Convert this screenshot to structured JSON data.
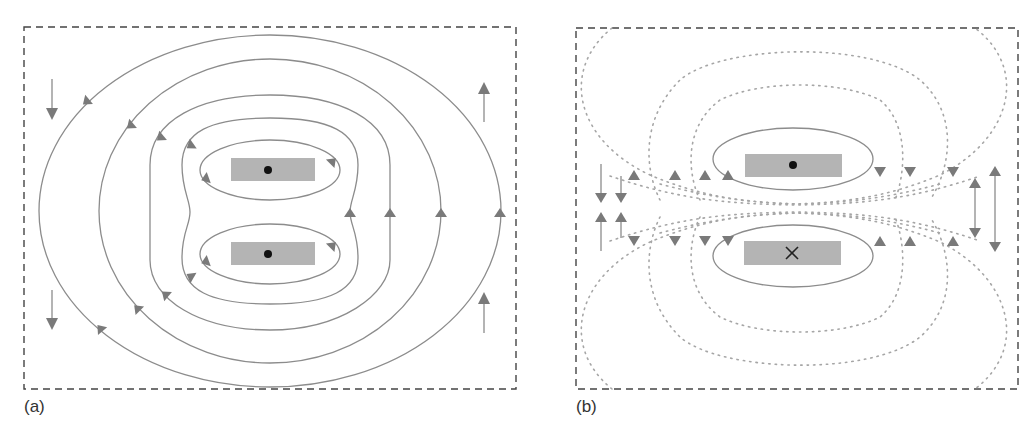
{
  "figure": {
    "panels": [
      {
        "id": "a",
        "label": "(a)",
        "description": "Two parallel conductors carrying current in the same direction (both out of page)",
        "conductors": [
          {
            "position": "top",
            "current_symbol": "dot",
            "meaning": "current out of page"
          },
          {
            "position": "bottom",
            "current_symbol": "dot",
            "meaning": "current out of page"
          }
        ],
        "field_lines": {
          "style": "solid",
          "count_individual_loops": 2,
          "count_enclosing_loops": 4,
          "circulation": "counter-clockwise"
        },
        "boundary_arrows": {
          "left": [
            "down",
            "down"
          ],
          "right": [
            "up",
            "up"
          ]
        }
      },
      {
        "id": "b",
        "label": "(b)",
        "description": "Two parallel conductors carrying current in opposite directions",
        "conductors": [
          {
            "position": "top",
            "current_symbol": "dot",
            "meaning": "current out of page"
          },
          {
            "position": "bottom",
            "current_symbol": "cross",
            "meaning": "current into page"
          }
        ],
        "field_lines": {
          "style": "solid loops near conductors, dotted lines through gap",
          "concentrated_between_conductors": true
        },
        "boundary_arrows": {
          "left": [
            "down",
            "down",
            "up",
            "up"
          ],
          "right": [
            "up/down",
            "up/down"
          ]
        }
      }
    ],
    "colors": {
      "frame": "#444444",
      "field_line": "#8c8c8c",
      "dotted_line": "#a6a6a6",
      "arrowhead": "#7a7a7a",
      "conductor": "#b4b4b4",
      "current_marker": "#111111"
    }
  }
}
